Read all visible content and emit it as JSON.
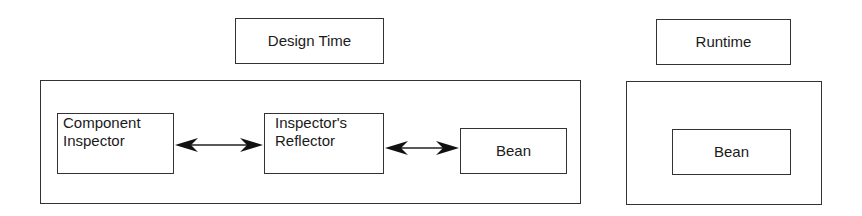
{
  "diagram": {
    "sections": [
      {
        "id": "design-time",
        "title": "Design Time",
        "nodes": [
          {
            "id": "component-inspector",
            "lines": [
              "Component",
              "Inspector"
            ]
          },
          {
            "id": "inspectors-reflector",
            "lines": [
              "Inspector's",
              "Reflector"
            ]
          },
          {
            "id": "bean",
            "lines": [
              "Bean"
            ]
          }
        ],
        "edges": [
          {
            "from": "component-inspector",
            "to": "inspectors-reflector",
            "type": "bidirectional"
          },
          {
            "from": "inspectors-reflector",
            "to": "bean",
            "type": "bidirectional"
          }
        ]
      },
      {
        "id": "runtime",
        "title": "Runtime",
        "nodes": [
          {
            "id": "bean",
            "lines": [
              "Bean"
            ]
          }
        ],
        "edges": []
      }
    ],
    "colors": {
      "stroke": "#333333",
      "text": "#1a1a1a",
      "background": "#ffffff"
    }
  }
}
